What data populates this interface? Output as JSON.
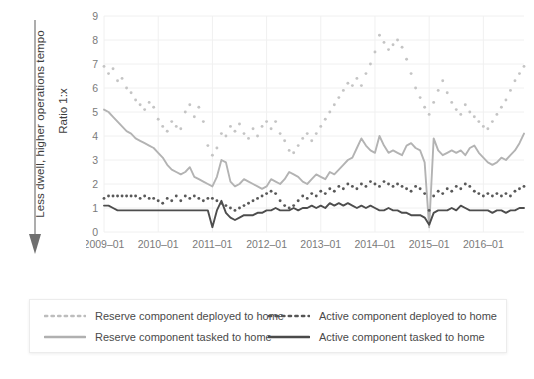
{
  "annotation": {
    "text": "Less dwell, higher operations tempo",
    "arrow_icon": "down-arrow-icon"
  },
  "axes": {
    "ylabel": "Ratio 1:x",
    "yticks": [
      "0",
      "1",
      "2",
      "3",
      "4",
      "5",
      "6",
      "7",
      "8",
      "9"
    ],
    "xticks": [
      "2009–01",
      "2010–01",
      "2011–01",
      "2012–01",
      "2013–01",
      "2014–01",
      "2015–01",
      "2016–01"
    ]
  },
  "legend": {
    "items": [
      {
        "label": "Reserve component deployed to home",
        "color": "#bdbdbd",
        "style": "dotted"
      },
      {
        "label": "Reserve component tasked to home",
        "color": "#b0b0b0",
        "style": "solid"
      },
      {
        "label": "Active component deployed to home",
        "color": "#555555",
        "style": "dotted"
      },
      {
        "label": "Active component tasked to home",
        "color": "#4a4a4a",
        "style": "solid"
      }
    ]
  },
  "colors": {
    "reserve_deployed": "#c4c4c4",
    "reserve_tasked": "#b3b3b3",
    "active_deployed": "#585858",
    "active_tasked": "#4d4d4d",
    "grid": "#f0f0f0",
    "tick_text": "#7a7a7a",
    "annotation_text": "#3d3d3d",
    "background": "#ffffff"
  },
  "chart_data": {
    "type": "line",
    "title": "",
    "xlabel": "",
    "ylabel": "Ratio 1:x",
    "xlim": [
      "2009-01",
      "2016-10"
    ],
    "ylim": [
      0,
      9
    ],
    "grid": true,
    "legend_position": "bottom",
    "x": [
      "2009-01",
      "2009-02",
      "2009-03",
      "2009-04",
      "2009-05",
      "2009-06",
      "2009-07",
      "2009-08",
      "2009-09",
      "2009-10",
      "2009-11",
      "2009-12",
      "2010-01",
      "2010-02",
      "2010-03",
      "2010-04",
      "2010-05",
      "2010-06",
      "2010-07",
      "2010-08",
      "2010-09",
      "2010-10",
      "2010-11",
      "2010-12",
      "2011-01",
      "2011-02",
      "2011-03",
      "2011-04",
      "2011-05",
      "2011-06",
      "2011-07",
      "2011-08",
      "2011-09",
      "2011-10",
      "2011-11",
      "2011-12",
      "2012-01",
      "2012-02",
      "2012-03",
      "2012-04",
      "2012-05",
      "2012-06",
      "2012-07",
      "2012-08",
      "2012-09",
      "2012-10",
      "2012-11",
      "2012-12",
      "2013-01",
      "2013-02",
      "2013-03",
      "2013-04",
      "2013-05",
      "2013-06",
      "2013-07",
      "2013-08",
      "2013-09",
      "2013-10",
      "2013-11",
      "2013-12",
      "2014-01",
      "2014-02",
      "2014-03",
      "2014-04",
      "2014-05",
      "2014-06",
      "2014-07",
      "2014-08",
      "2014-09",
      "2014-10",
      "2014-11",
      "2014-12",
      "2015-01",
      "2015-02",
      "2015-03",
      "2015-04",
      "2015-05",
      "2015-06",
      "2015-07",
      "2015-08",
      "2015-09",
      "2015-10",
      "2015-11",
      "2015-12",
      "2016-01",
      "2016-02",
      "2016-03",
      "2016-04",
      "2016-05",
      "2016-06",
      "2016-07",
      "2016-08",
      "2016-09",
      "2016-10"
    ],
    "series": [
      {
        "name": "Reserve component deployed to home",
        "style": "dotted",
        "color": "#c4c4c4",
        "values": [
          6.9,
          6.6,
          6.8,
          6.3,
          6.4,
          6.0,
          5.8,
          5.5,
          5.3,
          5.1,
          5.4,
          5.2,
          4.7,
          4.4,
          4.2,
          4.6,
          4.4,
          4.3,
          5.0,
          5.3,
          4.8,
          5.2,
          4.6,
          3.6,
          3.2,
          3.5,
          4.1,
          4.0,
          4.4,
          4.2,
          4.5,
          4.1,
          3.9,
          4.3,
          4.0,
          4.4,
          4.6,
          4.3,
          4.6,
          4.1,
          3.8,
          3.4,
          3.3,
          3.6,
          3.9,
          4.1,
          3.8,
          4.1,
          4.4,
          4.7,
          5.0,
          5.3,
          5.6,
          5.9,
          6.2,
          6.1,
          6.4,
          6.1,
          6.6,
          7.0,
          7.5,
          8.2,
          7.9,
          7.6,
          7.8,
          8.0,
          7.7,
          7.2,
          6.6,
          6.0,
          5.6,
          5.2,
          4.9,
          5.4,
          5.9,
          6.3,
          5.8,
          5.4,
          5.1,
          4.9,
          5.3,
          5.0,
          4.8,
          4.6,
          4.4,
          4.3,
          4.6,
          4.9,
          5.2,
          5.5,
          5.9,
          6.3,
          6.6,
          6.9
        ]
      },
      {
        "name": "Reserve component tasked to home",
        "style": "solid",
        "color": "#b3b3b3",
        "values": [
          5.1,
          5.0,
          4.8,
          4.6,
          4.4,
          4.2,
          4.1,
          3.9,
          3.8,
          3.7,
          3.6,
          3.5,
          3.3,
          3.1,
          2.8,
          2.6,
          2.5,
          2.4,
          2.5,
          2.7,
          2.3,
          2.2,
          2.1,
          2.0,
          1.9,
          2.3,
          3.0,
          2.9,
          2.1,
          1.9,
          2.0,
          2.2,
          2.1,
          2.0,
          1.9,
          1.8,
          1.9,
          2.2,
          2.1,
          2.0,
          2.2,
          2.5,
          2.4,
          2.3,
          2.1,
          2.0,
          2.2,
          2.4,
          2.3,
          2.2,
          2.5,
          2.4,
          2.6,
          2.8,
          3.0,
          3.1,
          3.5,
          3.9,
          3.6,
          3.4,
          3.3,
          4.0,
          3.6,
          3.3,
          3.4,
          3.3,
          3.2,
          3.6,
          3.7,
          3.5,
          3.4,
          2.9,
          0.2,
          3.9,
          3.4,
          3.2,
          3.3,
          3.4,
          3.3,
          3.4,
          3.2,
          3.5,
          3.6,
          3.3,
          3.1,
          2.9,
          2.8,
          2.9,
          3.1,
          3.0,
          3.2,
          3.4,
          3.7,
          4.1
        ]
      },
      {
        "name": "Active component deployed to home",
        "style": "dotted",
        "color": "#585858",
        "values": [
          1.4,
          1.5,
          1.5,
          1.5,
          1.5,
          1.5,
          1.5,
          1.5,
          1.4,
          1.5,
          1.4,
          1.4,
          1.3,
          1.2,
          1.4,
          1.3,
          1.5,
          1.3,
          1.5,
          1.4,
          1.5,
          1.4,
          1.3,
          1.4,
          1.4,
          1.3,
          1.2,
          1.1,
          1.0,
          0.9,
          1.0,
          1.1,
          1.2,
          1.3,
          1.4,
          1.5,
          1.6,
          1.7,
          1.6,
          1.3,
          1.1,
          1.0,
          1.1,
          1.3,
          1.5,
          1.4,
          1.6,
          1.5,
          1.7,
          1.6,
          1.8,
          1.7,
          1.9,
          1.8,
          2.0,
          1.9,
          1.8,
          2.0,
          1.9,
          2.1,
          2.0,
          1.9,
          2.1,
          2.0,
          1.9,
          2.0,
          1.9,
          1.8,
          1.7,
          1.9,
          1.8,
          1.6,
          0.9,
          1.5,
          1.7,
          1.6,
          1.8,
          1.7,
          1.9,
          1.8,
          2.0,
          1.9,
          1.7,
          1.6,
          1.5,
          1.6,
          1.5,
          1.6,
          1.5,
          1.6,
          1.5,
          1.7,
          1.8,
          1.9
        ]
      },
      {
        "name": "Active component tasked to home",
        "style": "solid",
        "color": "#4d4d4d",
        "values": [
          1.1,
          1.1,
          1.0,
          0.9,
          0.9,
          0.9,
          0.9,
          0.9,
          0.9,
          0.9,
          0.9,
          0.9,
          0.9,
          0.9,
          0.9,
          0.9,
          0.9,
          0.9,
          0.9,
          0.9,
          0.9,
          0.9,
          0.9,
          0.9,
          0.2,
          0.9,
          1.3,
          0.8,
          0.6,
          0.5,
          0.6,
          0.7,
          0.7,
          0.7,
          0.8,
          0.8,
          0.9,
          0.9,
          1.0,
          0.9,
          0.9,
          0.9,
          1.0,
          0.9,
          1.0,
          1.0,
          1.1,
          1.0,
          1.1,
          1.0,
          1.2,
          1.1,
          1.2,
          1.1,
          1.2,
          1.1,
          1.0,
          1.1,
          1.0,
          1.1,
          1.0,
          0.9,
          0.9,
          1.0,
          0.9,
          0.9,
          0.8,
          0.8,
          0.7,
          0.7,
          0.7,
          0.6,
          0.3,
          0.8,
          0.9,
          0.9,
          0.9,
          1.0,
          0.9,
          1.1,
          1.0,
          0.9,
          0.9,
          0.9,
          0.9,
          0.9,
          0.8,
          0.9,
          0.9,
          0.8,
          0.9,
          0.9,
          1.0,
          1.0
        ]
      }
    ]
  }
}
